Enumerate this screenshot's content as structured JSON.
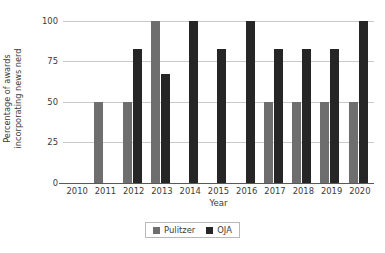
{
  "chart_data": {
    "type": "bar",
    "title": "",
    "subtitle": "",
    "xlabel": "Year",
    "ylabel": "Percentage of awards incorporating news nerd",
    "ylabel_lines": [
      "Percentage of awards",
      "incorporating news nerd"
    ],
    "categories": [
      "2010",
      "2011",
      "2012",
      "2013",
      "2014",
      "2015",
      "2016",
      "2017",
      "2018",
      "2019",
      "2020"
    ],
    "series": [
      {
        "name": "Pulitzer",
        "color": "#6e6e6e",
        "values": [
          0,
          50,
          50,
          100,
          0,
          0,
          0,
          50,
          50,
          50,
          50
        ]
      },
      {
        "name": "OJA",
        "color": "#262626",
        "values": [
          0,
          0,
          83,
          67,
          100,
          83,
          100,
          83,
          83,
          83,
          100
        ]
      }
    ],
    "ylim": [
      0,
      100
    ],
    "yticks": [
      0,
      25,
      50,
      75,
      100
    ],
    "ytick_labels": [
      "0",
      "25",
      "50",
      "75",
      "100"
    ],
    "grid": true,
    "grid_axis": "y",
    "legend_position": "bottom-center",
    "legend_entries": [
      {
        "label": "Pulitzer",
        "color": "#6e6e6e"
      },
      {
        "label": "OJA",
        "color": "#262626"
      }
    ]
  },
  "colors": {
    "background": "#ffffff",
    "text": "#3a3a3a",
    "gridline": "#c9c9c9",
    "axis": "#595959",
    "pulitzer": "#6e6e6e",
    "oja": "#262626"
  }
}
